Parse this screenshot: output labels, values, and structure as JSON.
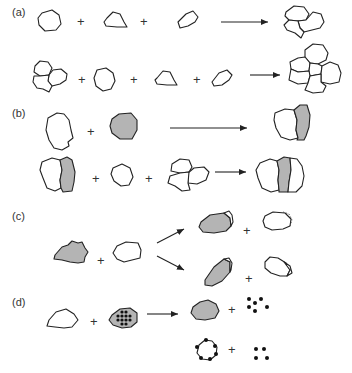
{
  "panels": [
    {
      "id": "a",
      "label": "(a)",
      "description": "Individual particles combine into aggregates; aggregates plus particles form larger aggregate"
    },
    {
      "id": "b",
      "label": "(b)",
      "description": "White particle plus gray particle forms combined pair; pair plus particles forms larger combined aggregate"
    },
    {
      "id": "c",
      "label": "(c)",
      "description": "Gray particle plus white particle collide; two outcome paths with partial transfer"
    },
    {
      "id": "d",
      "label": "(d)",
      "description": "White particle plus gray particle containing dots yields gray particle plus released dots, or white particle with surface dots plus dots"
    }
  ],
  "symbols": {
    "plus": "+"
  },
  "colors": {
    "outline": "#222222",
    "gray_fill": "#b4b4b4",
    "white_fill": "#ffffff",
    "dot": "#111111"
  }
}
